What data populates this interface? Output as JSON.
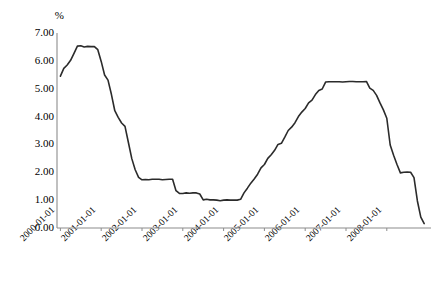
{
  "chart_data": {
    "type": "line",
    "title": "",
    "subtitle": "",
    "xlabel": "",
    "ylabel": "%",
    "unit_label": "%",
    "ylim": [
      0.0,
      7.0
    ],
    "y_step": 1.0,
    "y_ticks": [
      "0.00",
      "1.00",
      "2.00",
      "3.00",
      "4.00",
      "5.00",
      "6.00",
      "7.00"
    ],
    "y_tick_values": [
      0.0,
      1.0,
      2.0,
      3.0,
      4.0,
      5.0,
      6.0,
      7.0
    ],
    "x_ticks": [
      "2000-01-01",
      "2001-01-01",
      "2002-01-01",
      "2003-01-01",
      "2004-01-01",
      "2005-01-01",
      "2006-01-01",
      "2007-01-01",
      "2008-01-01"
    ],
    "xlim": [
      "2000-01-01",
      "2009-01-01"
    ],
    "grid": false,
    "legend": false,
    "legend_position": "none",
    "line_color": "#2b2b2b",
    "axis_color": "#8c8c8c",
    "background_color": "#ffffff",
    "series": [
      {
        "name": "rate",
        "x": [
          "2000-01-01",
          "2000-02-01",
          "2000-03-01",
          "2000-04-01",
          "2000-05-01",
          "2000-06-01",
          "2000-07-01",
          "2000-08-01",
          "2000-09-01",
          "2000-10-01",
          "2000-11-01",
          "2000-12-01",
          "2001-01-01",
          "2001-02-01",
          "2001-03-01",
          "2001-04-01",
          "2001-05-01",
          "2001-06-01",
          "2001-07-01",
          "2001-08-01",
          "2001-09-01",
          "2001-10-01",
          "2001-11-01",
          "2001-12-01",
          "2002-01-01",
          "2002-02-01",
          "2002-03-01",
          "2002-04-01",
          "2002-05-01",
          "2002-06-01",
          "2002-07-01",
          "2002-08-01",
          "2002-09-01",
          "2002-10-01",
          "2002-11-01",
          "2002-12-01",
          "2003-01-01",
          "2003-02-01",
          "2003-03-01",
          "2003-04-01",
          "2003-05-01",
          "2003-06-01",
          "2003-07-01",
          "2003-08-01",
          "2003-09-01",
          "2003-10-01",
          "2003-11-01",
          "2003-12-01",
          "2004-01-01",
          "2004-02-01",
          "2004-03-01",
          "2004-04-01",
          "2004-05-01",
          "2004-06-01",
          "2004-07-01",
          "2004-08-01",
          "2004-09-01",
          "2004-10-01",
          "2004-11-01",
          "2004-12-01",
          "2005-01-01",
          "2005-02-01",
          "2005-03-01",
          "2005-04-01",
          "2005-05-01",
          "2005-06-01",
          "2005-07-01",
          "2005-08-01",
          "2005-09-01",
          "2005-10-01",
          "2005-11-01",
          "2005-12-01",
          "2006-01-01",
          "2006-02-01",
          "2006-03-01",
          "2006-04-01",
          "2006-05-01",
          "2006-06-01",
          "2006-07-01",
          "2006-08-01",
          "2006-09-01",
          "2006-10-01",
          "2006-11-01",
          "2006-12-01",
          "2007-01-01",
          "2007-02-01",
          "2007-03-01",
          "2007-04-01",
          "2007-05-01",
          "2007-06-01",
          "2007-07-01",
          "2007-08-01",
          "2007-09-01",
          "2007-10-01",
          "2007-11-01",
          "2007-12-01",
          "2008-01-01",
          "2008-02-01",
          "2008-03-01",
          "2008-04-01",
          "2008-05-01",
          "2008-06-01",
          "2008-07-01",
          "2008-08-01",
          "2008-09-01",
          "2008-10-01",
          "2008-11-01",
          "2008-12-01"
        ],
        "values": [
          5.45,
          5.73,
          5.85,
          6.02,
          6.27,
          6.53,
          6.54,
          6.5,
          6.52,
          6.51,
          6.51,
          6.4,
          5.98,
          5.49,
          5.31,
          4.8,
          4.21,
          3.97,
          3.77,
          3.65,
          3.07,
          2.49,
          2.09,
          1.82,
          1.73,
          1.74,
          1.73,
          1.75,
          1.75,
          1.75,
          1.73,
          1.74,
          1.75,
          1.75,
          1.34,
          1.24,
          1.24,
          1.26,
          1.25,
          1.26,
          1.26,
          1.22,
          1.01,
          1.03,
          1.01,
          1.01,
          1.0,
          0.98,
          1.0,
          1.01,
          1.0,
          1.0,
          1.0,
          1.03,
          1.26,
          1.43,
          1.61,
          1.76,
          1.93,
          2.16,
          2.28,
          2.5,
          2.63,
          2.79,
          3.0,
          3.04,
          3.26,
          3.5,
          3.62,
          3.78,
          4.0,
          4.16,
          4.29,
          4.49,
          4.59,
          4.79,
          4.94,
          4.99,
          5.24,
          5.25,
          5.25,
          5.25,
          5.25,
          5.24,
          5.25,
          5.26,
          5.26,
          5.25,
          5.25,
          5.25,
          5.26,
          5.02,
          4.94,
          4.76,
          4.49,
          4.24,
          3.94,
          2.98,
          2.61,
          2.28,
          1.98,
          2.0,
          2.01,
          2.0,
          1.81,
          0.97,
          0.39,
          0.16
        ]
      }
    ],
    "annotations": []
  }
}
